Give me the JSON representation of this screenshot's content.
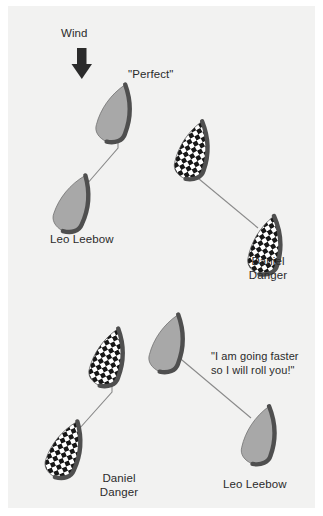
{
  "figure": {
    "type": "sailing-tactics-diagram",
    "background_color": "#f2f2f1",
    "page_color": "#ffffff",
    "hull_gray_fill": "#a8a8a8",
    "hull_outline_color": "#4d4d4d",
    "checker_dark_color": "#1a1a1a",
    "checker_light_color": "#ffffff",
    "line_color": "#7a7a7a",
    "text_color": "#2b2b2b"
  },
  "annotations": {
    "wind_label": "Wind",
    "wind_arrow_icon": "down-arrow-icon",
    "perfect_label": "\"Perfect\"",
    "speech_line1": "\"I am going faster",
    "speech_line2": "so I will roll you!\"",
    "pointer_arrow_icon": "arrow-pointer-icon"
  },
  "scenes": [
    {
      "name": "top-scene",
      "boats": [
        {
          "id": "top-leo-leading",
          "skipper": "Leo Leebow",
          "hull_style": "gray",
          "label": "",
          "callout": "\"Perfect\""
        },
        {
          "id": "top-leo-trailing",
          "skipper": "Leo Leebow",
          "hull_style": "gray",
          "label": "Leo Leebow"
        },
        {
          "id": "top-daniel-leading",
          "skipper": "Daniel Danger",
          "hull_style": "checker",
          "label": ""
        },
        {
          "id": "top-daniel-trailing",
          "skipper": "Daniel Danger",
          "hull_style": "checker",
          "label_line1": "Daniel",
          "label_line2": "Danger"
        }
      ]
    },
    {
      "name": "bottom-scene",
      "boats": [
        {
          "id": "bottom-leo-leading",
          "skipper": "Leo Leebow",
          "hull_style": "gray",
          "label": ""
        },
        {
          "id": "bottom-leo-trailing",
          "skipper": "Leo Leebow",
          "hull_style": "gray",
          "label": "Leo Leebow"
        },
        {
          "id": "bottom-daniel-leading",
          "skipper": "Daniel Danger",
          "hull_style": "checker",
          "label": ""
        },
        {
          "id": "bottom-daniel-trailing",
          "skipper": "Daniel Danger",
          "hull_style": "checker",
          "label_line1": "Daniel",
          "label_line2": "Danger"
        }
      ]
    }
  ],
  "labels": {
    "top_leo_leebow": "Leo Leebow",
    "top_daniel_line1": "Daniel",
    "top_daniel_line2": "Danger",
    "bottom_daniel_line1": "Daniel",
    "bottom_daniel_line2": "Danger",
    "bottom_leo_leebow": "Leo Leebow"
  }
}
